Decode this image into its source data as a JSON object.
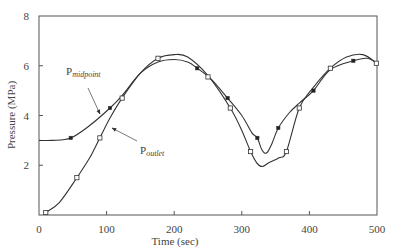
{
  "chart_data": {
    "type": "line",
    "title": "",
    "xlabel": "Time (sec)",
    "ylabel": "Pressure (MPa)",
    "xlim": [
      0,
      500
    ],
    "ylim": [
      0,
      8
    ],
    "xticks": [
      0,
      100,
      200,
      300,
      400,
      500
    ],
    "yticks": [
      2,
      4,
      6,
      8
    ],
    "ytick_labels": [
      "2",
      "4",
      "6",
      "8"
    ],
    "xtick_labels": [
      "0",
      "100",
      "200",
      "300",
      "400",
      "500"
    ],
    "grid": false,
    "legend": "inline annotations with arrows",
    "series": [
      {
        "name": "P_midpoint",
        "label_main": "P",
        "label_sub": "midpoint",
        "marker": "filled-square",
        "color": "#333333",
        "curve": [
          [
            0,
            3.0
          ],
          [
            20,
            3.0
          ],
          [
            47,
            3.1
          ],
          [
            75,
            3.6
          ],
          [
            105,
            4.3
          ],
          [
            123,
            4.8
          ],
          [
            150,
            5.7
          ],
          [
            176,
            6.15
          ],
          [
            200,
            6.25
          ],
          [
            220,
            6.15
          ],
          [
            234,
            5.9
          ],
          [
            255,
            5.45
          ],
          [
            279,
            4.7
          ],
          [
            300,
            4.0
          ],
          [
            315,
            3.3
          ],
          [
            323,
            3.1
          ],
          [
            330,
            2.6
          ],
          [
            337,
            2.5
          ],
          [
            345,
            2.9
          ],
          [
            354,
            3.5
          ],
          [
            370,
            4.1
          ],
          [
            385,
            4.5
          ],
          [
            406,
            5.0
          ],
          [
            431,
            5.85
          ],
          [
            465,
            6.2
          ],
          [
            485,
            6.3
          ],
          [
            500,
            6.1
          ]
        ],
        "markers": [
          [
            47,
            3.1
          ],
          [
            105,
            4.3
          ],
          [
            234,
            5.9
          ],
          [
            279,
            4.7
          ],
          [
            323,
            3.1
          ],
          [
            354,
            3.5
          ],
          [
            406,
            5.0
          ],
          [
            465,
            6.2
          ]
        ]
      },
      {
        "name": "P_outlet",
        "label_main": "P",
        "label_sub": "outlet",
        "marker": "open-square",
        "color": "#333333",
        "curve": [
          [
            10,
            0.1
          ],
          [
            30,
            0.5
          ],
          [
            56,
            1.5
          ],
          [
            75,
            2.3
          ],
          [
            90,
            3.1
          ],
          [
            105,
            3.9
          ],
          [
            123,
            4.7
          ],
          [
            150,
            5.7
          ],
          [
            176,
            6.3
          ],
          [
            200,
            6.45
          ],
          [
            220,
            6.35
          ],
          [
            250,
            5.6
          ],
          [
            283,
            4.3
          ],
          [
            300,
            3.4
          ],
          [
            313,
            2.55
          ],
          [
            322,
            2.1
          ],
          [
            330,
            1.95
          ],
          [
            340,
            2.1
          ],
          [
            355,
            2.3
          ],
          [
            366,
            2.55
          ],
          [
            385,
            4.3
          ],
          [
            405,
            5.1
          ],
          [
            431,
            5.9
          ],
          [
            455,
            6.35
          ],
          [
            479,
            6.45
          ],
          [
            500,
            6.1
          ]
        ],
        "markers": [
          [
            10,
            0.1
          ],
          [
            56,
            1.5
          ],
          [
            90,
            3.1
          ],
          [
            123,
            4.7
          ],
          [
            176,
            6.3
          ],
          [
            250,
            5.55
          ],
          [
            283,
            4.3
          ],
          [
            313,
            2.55
          ],
          [
            366,
            2.55
          ],
          [
            385,
            4.3
          ],
          [
            431,
            5.9
          ],
          [
            499,
            6.1
          ]
        ]
      }
    ],
    "annotations": [
      {
        "text": "P_midpoint",
        "label_pos": [
          66,
          75
        ],
        "arrow_from": [
          88,
          88
        ],
        "arrow_to": [
          100,
          114
        ]
      },
      {
        "text": "P_outlet",
        "label_pos": [
          140,
          154
        ],
        "arrow_from": [
          137,
          141
        ],
        "arrow_to": [
          112,
          128
        ]
      }
    ]
  },
  "plot_area": {
    "left": 39,
    "right": 377,
    "top": 16,
    "bottom": 215
  }
}
